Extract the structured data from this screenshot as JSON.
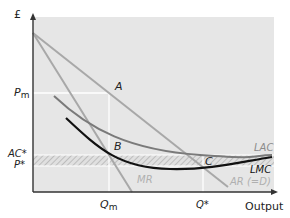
{
  "diagram": {
    "y_axis_label": "£",
    "x_axis_label": "Output",
    "price_labels": {
      "pm": "P",
      "pm_sub": "m",
      "ac_star": "AC*",
      "p_star": "P*"
    },
    "quantity_labels": {
      "qm": "Q",
      "qm_sub": "m",
      "q_star": "Q*"
    },
    "points": {
      "a": "A",
      "b": "B",
      "c": "C"
    },
    "curves": {
      "lac": "LAC",
      "lmc": "LMC",
      "mr": "MR",
      "ar": "AR (=D)"
    },
    "colors": {
      "background_panel": "#e6e6e6",
      "demand_lines": "#a8a8a8",
      "lac": "#7a7a7a",
      "lmc": "#111111",
      "guide_lines": "#ffffff",
      "hatch": "#c9c9c9"
    }
  }
}
